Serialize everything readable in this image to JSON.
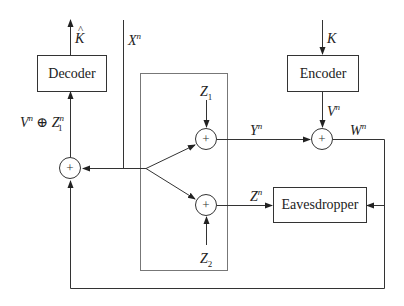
{
  "diagram": {
    "type": "block-diagram",
    "blocks": {
      "decoder": "Decoder",
      "encoder": "Encoder",
      "eavesdropper": "Eavesdropper"
    },
    "adders": [
      "adder-z1",
      "adder-z2",
      "adder-vn",
      "adder-decoder"
    ],
    "adder_symbol": "+",
    "labels": {
      "k_hat": "K",
      "k": "K",
      "x_base": "X",
      "x_sup": "n",
      "v_base": "V",
      "v_sup": "n",
      "y_base": "Y",
      "y_sup": "n",
      "w_base": "W",
      "w_sup": "n",
      "z_base": "Z",
      "z_sup": "n",
      "z1_base": "Z",
      "z1_sub": "1",
      "z2_base": "Z",
      "z2_sub": "2",
      "dec_in_v": "V",
      "dec_in_v_sup": "n",
      "dec_in_op": " ⊕ ",
      "dec_in_z": "Z",
      "dec_in_z_sup": "n",
      "dec_in_z_sub": "1"
    },
    "edges": [
      {
        "from": "decoder",
        "to": "output",
        "label": "K̂"
      },
      {
        "from": "input",
        "to": "encoder",
        "label": "K"
      },
      {
        "from": "encoder",
        "to": "adder-vn",
        "label": "V^n"
      },
      {
        "from": "adder-z1",
        "to": "adder-vn",
        "label": "Y^n"
      },
      {
        "from": "adder-vn",
        "to": "eavesdropper",
        "label": "W^n"
      },
      {
        "from": "adder-vn",
        "to": "adder-decoder",
        "label": "W^n (feedback)"
      },
      {
        "from": "adder-z2",
        "to": "eavesdropper",
        "label": "Z^n"
      },
      {
        "from": "split",
        "to": "adder-z1",
        "label": "X^n"
      },
      {
        "from": "split",
        "to": "adder-z2",
        "label": "X^n"
      },
      {
        "from": "split",
        "to": "adder-decoder",
        "label": "X^n"
      },
      {
        "from": "adder-decoder",
        "to": "decoder",
        "label": "V^n ⊕ Z_1^n"
      }
    ]
  }
}
